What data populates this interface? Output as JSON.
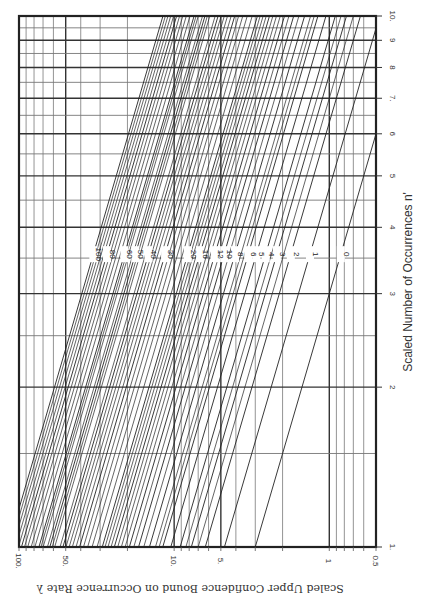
{
  "chart_data": {
    "type": "line",
    "title": "",
    "orientation_note": "Printed rotated: λ axis runs horizontally (bottom, reversed, upside-down labels), n' axis vertical on right",
    "xlabel": "Scaled Upper Confidence Bound on Occurrence Rate λ",
    "ylabel": "Scaled Number of Occurrences n'",
    "x_scale": "log",
    "y_scale": "log",
    "xlim": [
      100,
      0.5
    ],
    "ylim": [
      1,
      10
    ],
    "x_ticks": [
      {
        "value": 100,
        "label": "100."
      },
      {
        "value": 50,
        "label": "50."
      },
      {
        "value": 10,
        "label": "10."
      },
      {
        "value": 5,
        "label": "5."
      },
      {
        "value": 1,
        "label": "1"
      },
      {
        "value": 0.5,
        "label": "0.5"
      }
    ],
    "y_ticks": [
      {
        "value": 1,
        "label": "1."
      },
      {
        "value": 2,
        "label": "2"
      },
      {
        "value": 3,
        "label": "3"
      },
      {
        "value": 4,
        "label": "4"
      },
      {
        "value": 5,
        "label": "5"
      },
      {
        "value": 6,
        "label": "6"
      },
      {
        "value": 7,
        "label": "7."
      },
      {
        "value": 8,
        "label": "8"
      },
      {
        "value": 9,
        "label": "9"
      },
      {
        "value": 10,
        "label": "10."
      }
    ],
    "x_grid": [
      100,
      90,
      80,
      70,
      60,
      50,
      40,
      30,
      20,
      10,
      9,
      8,
      7,
      6,
      5,
      4,
      3,
      2,
      1,
      0.9,
      0.8,
      0.7,
      0.6,
      0.5
    ],
    "x_grid_major": [
      100,
      50,
      10,
      5,
      1,
      0.5
    ],
    "y_grid": [
      1,
      1.5,
      2,
      2.5,
      3,
      3.5,
      4,
      4.5,
      5,
      5.5,
      6,
      6.5,
      7,
      7.5,
      8,
      8.5,
      9,
      9.5,
      10
    ],
    "y_grid_major": [
      1,
      2,
      3,
      4,
      5,
      6,
      7,
      8,
      9,
      10
    ],
    "grid": true,
    "relation": "lambda = U(x) / n'",
    "label_row_n": 3.56,
    "series": [
      {
        "name": "0",
        "U": 3.0
      },
      {
        "name": "1",
        "U": 4.74
      },
      {
        "name": "2",
        "U": 6.3
      },
      {
        "name": "3",
        "U": 7.75
      },
      {
        "name": "4",
        "U": 9.15
      },
      {
        "name": "5",
        "U": 10.51
      },
      {
        "name": "6",
        "U": 11.84
      },
      {
        "name": "8",
        "U": 14.43
      },
      {
        "name": "10",
        "U": 16.96
      },
      {
        "name": "12",
        "U": 19.44
      },
      {
        "name": "16",
        "U": 24.3
      },
      {
        "name": "20",
        "U": 29.06
      },
      {
        "name": "30",
        "U": 40.7
      },
      {
        "name": "40",
        "U": 52.1
      },
      {
        "name": "50",
        "U": 63.3
      },
      {
        "name": "60",
        "U": 74.4
      },
      {
        "name": "80",
        "U": 96.4
      },
      {
        "name": "100",
        "U": 118.1
      }
    ],
    "extra_lines_U": [
      7.0,
      8.4,
      12.5,
      13.2,
      15.7,
      18.2,
      20.7,
      21.9,
      23.1,
      25.5,
      26.7,
      27.9,
      31.4,
      33.8,
      36.1,
      38.4,
      42.9,
      45.3,
      47.5,
      49.8,
      54.4,
      58.9,
      61.1,
      65.6,
      69.9,
      72.2,
      79.0,
      83.5,
      87.9,
      92.2,
      100.8,
      105.2,
      109.6,
      113.9
    ]
  }
}
